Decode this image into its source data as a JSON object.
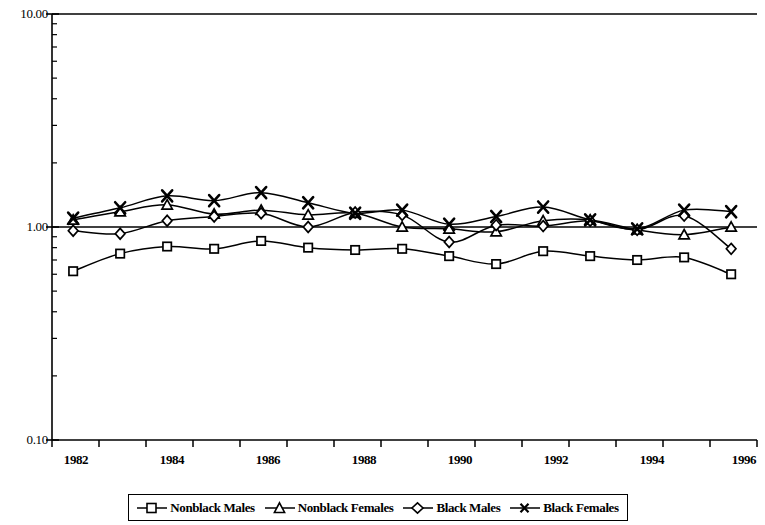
{
  "chart_data": {
    "type": "line",
    "title": "",
    "xlabel": "",
    "ylabel": "",
    "yscale": "log",
    "ylim": [
      0.1,
      10.0
    ],
    "ytick_labels": [
      "10.00",
      "1.00",
      "0.10"
    ],
    "ytick_values": [
      10.0,
      1.0,
      0.1
    ],
    "grid": false,
    "reference_line": 1.0,
    "legend_position": "bottom",
    "x": [
      1982,
      1983,
      1984,
      1985,
      1986,
      1987,
      1988,
      1989,
      1990,
      1991,
      1992,
      1993,
      1994,
      1995,
      1996
    ],
    "xtick_labels": [
      "1982",
      "",
      "1984",
      "",
      "1986",
      "",
      "1988",
      "",
      "1990",
      "",
      "1992",
      "",
      "1994",
      "",
      "1996"
    ],
    "xtick_labels_shown": [
      "1982",
      "1984",
      "1986",
      "1988",
      "1990",
      "1992",
      "1994",
      "1996"
    ],
    "series": [
      {
        "name": "Nonblack Males",
        "marker": "square",
        "values": [
          0.62,
          0.75,
          0.81,
          0.79,
          0.86,
          0.8,
          0.78,
          0.79,
          0.73,
          0.67,
          0.77,
          0.73,
          0.7,
          0.72,
          0.6
        ]
      },
      {
        "name": "Nonblack Females",
        "marker": "triangle",
        "values": [
          1.08,
          1.18,
          1.27,
          1.15,
          1.2,
          1.14,
          1.16,
          1.0,
          0.98,
          0.95,
          1.07,
          1.08,
          0.97,
          0.92,
          1.0
        ]
      },
      {
        "name": "Black Males",
        "marker": "diamond",
        "values": [
          0.96,
          0.93,
          1.07,
          1.12,
          1.16,
          1.0,
          1.17,
          1.14,
          0.85,
          1.02,
          1.01,
          1.07,
          0.97,
          1.13,
          0.79
        ]
      },
      {
        "name": "Black Females",
        "marker": "cross",
        "values": [
          1.1,
          1.23,
          1.4,
          1.33,
          1.45,
          1.3,
          1.16,
          1.2,
          1.03,
          1.12,
          1.24,
          1.08,
          0.98,
          1.2,
          1.18
        ]
      }
    ]
  },
  "legend": {
    "entries": [
      {
        "label": "Nonblack Males",
        "marker": "square-marker"
      },
      {
        "label": "Nonblack Females",
        "marker": "triangle-marker"
      },
      {
        "label": "Black Males",
        "marker": "diamond-marker"
      },
      {
        "label": "Black Females",
        "marker": "cross-marker"
      }
    ]
  },
  "colors": {
    "line": "#000000",
    "axis": "#000000",
    "background": "#ffffff"
  }
}
